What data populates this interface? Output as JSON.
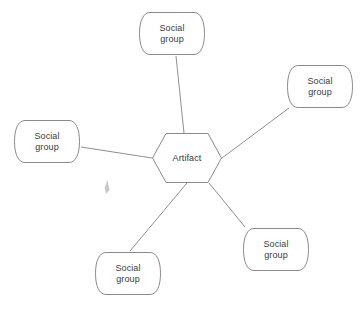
{
  "diagram": {
    "width": 364,
    "height": 309,
    "background_color": "#ffffff",
    "stroke_color": "#8a8a8a",
    "edge_color": "#8f8f8f",
    "text_color": "#3a3a3a",
    "center_node": {
      "id": "artifact",
      "label": "Artifact",
      "shape": "hexagon",
      "x": 152,
      "y": 133,
      "width": 70,
      "height": 50
    },
    "nodes": [
      {
        "id": "social-group-top",
        "label": "Social\ngroup",
        "shape": "tape",
        "x": 139,
        "y": 12,
        "width": 66,
        "height": 43
      },
      {
        "id": "social-group-right",
        "label": "Social\ngroup",
        "shape": "tape",
        "x": 287,
        "y": 65,
        "width": 66,
        "height": 43
      },
      {
        "id": "social-group-left",
        "label": "Social\ngroup",
        "shape": "tape",
        "x": 14,
        "y": 120,
        "width": 66,
        "height": 43
      },
      {
        "id": "social-group-bottom-left",
        "label": "Social\ngroup",
        "shape": "tape",
        "x": 95,
        "y": 252,
        "width": 66,
        "height": 43
      },
      {
        "id": "social-group-bottom-right",
        "label": "Social\ngroup",
        "shape": "tape",
        "x": 243,
        "y": 228,
        "width": 66,
        "height": 43
      }
    ],
    "edges": [
      {
        "id": "edge-artifact-top",
        "from": "artifact",
        "to": "social-group-top",
        "x1": 184,
        "y1": 133,
        "x2": 176,
        "y2": 56
      },
      {
        "id": "edge-artifact-right",
        "from": "artifact",
        "to": "social-group-right",
        "x1": 222,
        "y1": 158,
        "x2": 289,
        "y2": 108
      },
      {
        "id": "edge-artifact-left",
        "from": "artifact",
        "to": "social-group-left",
        "x1": 152,
        "y1": 158,
        "x2": 81,
        "y2": 147
      },
      {
        "id": "edge-artifact-bottom-left",
        "from": "artifact",
        "to": "social-group-bottom-left",
        "x1": 187,
        "y1": 183,
        "x2": 130,
        "y2": 251
      },
      {
        "id": "edge-artifact-bottom-right",
        "from": "artifact",
        "to": "social-group-bottom-right",
        "x1": 209,
        "y1": 183,
        "x2": 245,
        "y2": 227
      }
    ],
    "pointer_artifact": {
      "id": "cursor-smudge",
      "x": 104,
      "y": 180,
      "width": 6,
      "height": 14,
      "color": "#b8b8b8"
    }
  }
}
